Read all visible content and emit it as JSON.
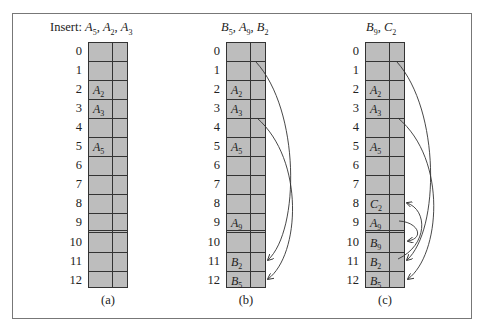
{
  "figure": {
    "panels": [
      {
        "id": "a",
        "title_prefix": "Insert: ",
        "title_items": [
          {
            "letter": "A",
            "sub": "5"
          },
          {
            "letter": "A",
            "sub": "2"
          },
          {
            "letter": "A",
            "sub": "3"
          }
        ],
        "caption": "(a)",
        "rows": [
          "0",
          "1",
          "2",
          "3",
          "4",
          "5",
          "6",
          "7",
          "8",
          "9",
          "10",
          "11",
          "12"
        ],
        "cells": {
          "2": {
            "letter": "A",
            "sub": "2"
          },
          "3": {
            "letter": "A",
            "sub": "3"
          },
          "5": {
            "letter": "A",
            "sub": "5"
          }
        },
        "pointers": []
      },
      {
        "id": "b",
        "title_prefix": "",
        "title_items": [
          {
            "letter": "B",
            "sub": "5"
          },
          {
            "letter": "A",
            "sub": "9"
          },
          {
            "letter": "B",
            "sub": "2"
          }
        ],
        "caption": "(b)",
        "rows": [
          "0",
          "1",
          "2",
          "3",
          "4",
          "5",
          "6",
          "7",
          "8",
          "9",
          "10",
          "11",
          "12"
        ],
        "cells": {
          "2": {
            "letter": "A",
            "sub": "2"
          },
          "3": {
            "letter": "A",
            "sub": "3"
          },
          "5": {
            "letter": "A",
            "sub": "5"
          },
          "9": {
            "letter": "A",
            "sub": "9"
          },
          "11": {
            "letter": "B",
            "sub": "2"
          },
          "12": {
            "letter": "B",
            "sub": "5"
          }
        },
        "pointers": [
          {
            "from": "2",
            "to": "11"
          },
          {
            "from": "5",
            "to": "12"
          }
        ]
      },
      {
        "id": "c",
        "title_prefix": "",
        "title_items": [
          {
            "letter": "B",
            "sub": "9"
          },
          {
            "letter": "C",
            "sub": "2"
          }
        ],
        "caption": "(c)",
        "rows": [
          "0",
          "1",
          "2",
          "3",
          "4",
          "5",
          "6",
          "7",
          "8",
          "9",
          "10",
          "11",
          "12"
        ],
        "cells": {
          "2": {
            "letter": "A",
            "sub": "2"
          },
          "3": {
            "letter": "A",
            "sub": "3"
          },
          "5": {
            "letter": "A",
            "sub": "5"
          },
          "8": {
            "letter": "C",
            "sub": "2"
          },
          "9": {
            "letter": "A",
            "sub": "9"
          },
          "10": {
            "letter": "B",
            "sub": "9"
          },
          "11": {
            "letter": "B",
            "sub": "2"
          },
          "12": {
            "letter": "B",
            "sub": "5"
          }
        },
        "pointers": [
          {
            "from": "2",
            "to": "11"
          },
          {
            "from": "5",
            "to": "12"
          },
          {
            "from": "9",
            "to": "10"
          },
          {
            "from": "11",
            "to": "8"
          }
        ]
      }
    ],
    "overflow_boundary_after_row": "9",
    "colors": {
      "cell_fill": "#bdbdbd",
      "line": "#333333",
      "frame": "#777777"
    }
  }
}
